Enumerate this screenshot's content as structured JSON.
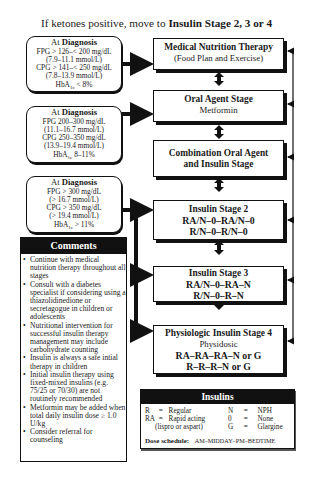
{
  "title": {
    "prefix": "If ketones positive, move to ",
    "emphasis": "Insulin Stage 2, 3 or 4"
  },
  "diagnosis_boxes": [
    {
      "heading_prefix": "At ",
      "heading_bold": "Diagnosis",
      "lines": [
        "FPG > 126–< 200 mg/dL",
        "(7.9–11.1 mmol/L)",
        "CPG > 141–< 250 mg/dL",
        "(7.8–13.9 mmol/L)"
      ],
      "hba_label": "HbA",
      "hba_sub": "1c",
      "hba_value": " < 8%"
    },
    {
      "heading_prefix": "At ",
      "heading_bold": "Diagnosis",
      "lines": [
        "FPG 200–300 mg/dL",
        "(11.1–16.7 mmol/L)",
        "CPG 250–350 mg/dL",
        "(13.9–19.4 mmol/L)"
      ],
      "hba_label": "HbA",
      "hba_sub": "1c",
      "hba_value": " 8–11%"
    },
    {
      "heading_prefix": "At ",
      "heading_bold": "Diagnosis",
      "lines": [
        "FPG > 300 mg/dL",
        "(> 16.7 mmol/L)",
        "CPG > 350 mg/dL",
        "(> 19.4 mmol/L)"
      ],
      "hba_label": "HbA",
      "hba_sub": "1c",
      "hba_value": " > 11%"
    }
  ],
  "stages": [
    {
      "title": "Medical Nutrition Therapy",
      "subtitle": "(Food Plan and Exercise)"
    },
    {
      "title": "Oral Agent Stage",
      "subtitle": "Metformin"
    },
    {
      "title_line1": "Combination Oral Agent",
      "title_line2": "and Insulin Stage"
    },
    {
      "title": "Insulin Stage 2",
      "regimen1": "RA/N–0–RA/N–0",
      "regimen2": "R/N–0–R/N–0"
    },
    {
      "title": "Insulin Stage 3",
      "regimen1": "RA/N–0–RA–N",
      "regimen2": "R/N–0–R–N"
    },
    {
      "title": "Physiologic Insulin Stage 4",
      "subtitle": "Physidosic",
      "regimen1": "RA–RA–RA–N or G",
      "regimen2": "R–R–R–N or G"
    }
  ],
  "comments": {
    "header": "Comments",
    "items": [
      "Continue with medical nutrition therapy throughout all stages",
      "Consult with a diabetes specialist if considering using a thiazolidinedione or secretagogue in children or adolescents",
      "Nutritional intervention for successful insulin therapy management may include carbohydrate counting",
      "Insulin is always a safe intial therapy in children",
      "Initial insulin therapy using fixed-mixed insulins (e.g. 75/25 or 70/30) are not routinely recommended",
      "Metformin may be added when total daily insulin dose ≥ 1.0 U/kg",
      "Consider referral for counseling"
    ]
  },
  "insulins": {
    "header": "Insulins",
    "legend": [
      {
        "code": "R",
        "eq": "=",
        "name": "Regular"
      },
      {
        "code": "RA",
        "eq": "=",
        "name": "Rapid acting"
      },
      {
        "code": "",
        "eq": "",
        "name": "(lispro or aspart)"
      },
      {
        "code": "N",
        "eq": "=",
        "name": "NPH"
      },
      {
        "code": "0",
        "eq": "=",
        "name": "None"
      },
      {
        "code": "G",
        "eq": "=",
        "name": "Glargine"
      }
    ],
    "dose_label": "Dose schedule:",
    "dose_value": "AM–MIDDAY–PM–BEDTIME"
  }
}
